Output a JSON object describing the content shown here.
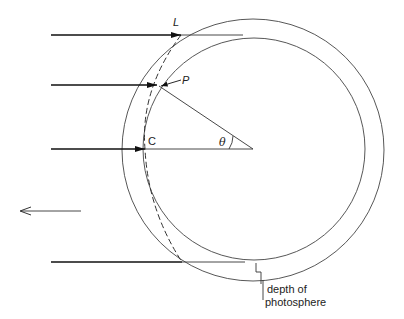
{
  "diagram": {
    "title": "",
    "labels": {
      "L": "L",
      "P": "P",
      "C": "C",
      "theta": "θ",
      "depth_line1": "depth of",
      "depth_line2": "photosphere"
    },
    "colors": {
      "stroke": "#333333",
      "arrow": "#111111",
      "background": "#ffffff"
    },
    "geometry": {
      "center": [
        253,
        149
      ],
      "outer_radius": 131,
      "inner_radius": 112,
      "incoming_rays_y": [
        35,
        85,
        149,
        262
      ],
      "outgoing_arrow_y": 211
    }
  }
}
